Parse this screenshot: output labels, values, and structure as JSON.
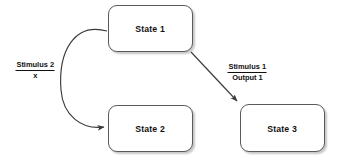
{
  "diagram": {
    "background_color": "#ffffff",
    "node_border_color": "#5a5a5a",
    "node_fill_color": "#ffffff",
    "edge_color": "#3a3a3a",
    "text_color": "#111111",
    "nodes": [
      {
        "id": "state1",
        "label": "State 1",
        "x": 108,
        "y": 5,
        "w": 85,
        "h": 47
      },
      {
        "id": "state2",
        "label": "State 2",
        "x": 108,
        "y": 105,
        "w": 85,
        "h": 47
      },
      {
        "id": "state3",
        "label": "State 3",
        "x": 240,
        "y": 104,
        "w": 85,
        "h": 48
      }
    ],
    "edges": [
      {
        "id": "edge-state1-state2",
        "from": "state1",
        "to": "state2",
        "style": "curved",
        "trigger": "Stimulus 2",
        "output": "x",
        "label_x": 14,
        "label_y": 61
      },
      {
        "id": "edge-state1-state3",
        "from": "state1",
        "to": "state3",
        "style": "straight",
        "trigger": "Stimulus 1",
        "output": "Output 1",
        "label_x": 226,
        "label_y": 63
      }
    ]
  }
}
